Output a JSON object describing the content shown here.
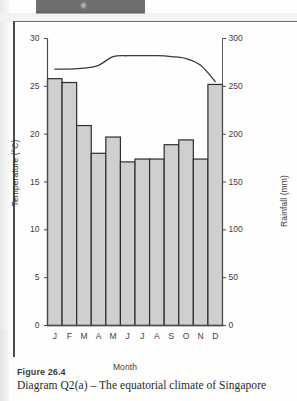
{
  "banner": {
    "glyph_icon": "pen-nib-icon"
  },
  "figure": {
    "number": "Figure 26.4",
    "caption": "Diagram Q2(a) – The equatorial climate of Singapore"
  },
  "colors": {
    "bar_fill": "#cfcfcf",
    "bar_stroke": "#2d2d2d",
    "line_stroke": "#3a3a3a",
    "axis": "#4a4a4a",
    "text": "#3d3d3d",
    "banner": "#6f6f6f"
  },
  "chart_data": {
    "type": "bar",
    "title": "Diagram Q2(a) – The equatorial climate of Singapore",
    "xlabel": "Month",
    "ylabel": "Temperature (°C)",
    "y2label": "Rainfall (mm)",
    "grid": false,
    "legend": "none",
    "categories": [
      "J",
      "F",
      "M",
      "A",
      "M",
      "J",
      "J",
      "A",
      "S",
      "O",
      "N",
      "D"
    ],
    "month_names": [
      "January",
      "February",
      "March",
      "April",
      "May",
      "June",
      "July",
      "August",
      "September",
      "October",
      "November",
      "December"
    ],
    "ylim": [
      0,
      30
    ],
    "y2lim": [
      0,
      300
    ],
    "yticks": [
      0,
      5,
      10,
      15,
      20,
      25,
      30
    ],
    "y2ticks": [
      0,
      50,
      100,
      150,
      200,
      250,
      300
    ],
    "series": [
      {
        "name": "Rainfall (mm)",
        "type": "bar",
        "axis": "right",
        "units": "mm",
        "values": [
          258,
          254,
          209,
          180,
          197,
          171,
          174,
          174,
          189,
          194,
          174,
          252
        ]
      },
      {
        "name": "Temperature (°C)",
        "type": "line",
        "axis": "left",
        "units": "°C",
        "values": [
          26.8,
          26.8,
          26.9,
          27.2,
          28.1,
          28.2,
          28.2,
          28.2,
          28.1,
          27.9,
          27.2,
          25.5
        ]
      }
    ]
  }
}
